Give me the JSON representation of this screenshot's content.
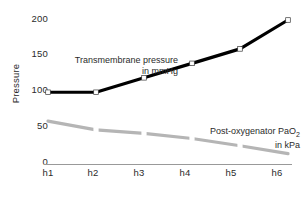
{
  "chart_data": {
    "type": "line",
    "title": "",
    "xlabel": "Time",
    "ylabel": "Pressure",
    "categories": [
      "h1",
      "h2",
      "h3",
      "h4",
      "h5",
      "h6"
    ],
    "yticks": [
      0,
      50,
      100,
      150,
      200
    ],
    "ylim": [
      0,
      215
    ],
    "grid": false,
    "legend_position": "inline-annotation",
    "series": [
      {
        "name": "Transmembrane pressure in mmHg",
        "name_line1": "Transmembrane pressure",
        "name_line2": "in mmHg",
        "unit": "mmHg",
        "color": "#000000",
        "marker": "open-square",
        "values": [
          100,
          100,
          120,
          140,
          160,
          200
        ]
      },
      {
        "name": "Post-oxygenator PaO2 in kPa",
        "name_line1_pre": "Post-oxygenator PaO",
        "name_line1_sub": "2",
        "name_line2": "in kPa",
        "unit": "kPa",
        "color": "#b5b5b5",
        "marker": "gap",
        "values": [
          60,
          48,
          43,
          36,
          26,
          15
        ]
      }
    ]
  },
  "axes": {
    "y_title": "Pressure",
    "x_title": "Time",
    "y_tick_labels": [
      "200",
      "150",
      "100",
      "50",
      "0"
    ],
    "x_tick_labels": [
      "h1",
      "h2",
      "h3",
      "h4",
      "h5",
      "h6"
    ]
  },
  "colors": {
    "background": "#ffffff",
    "axis_line": "#999999",
    "series_black": "#000000",
    "series_gray": "#b5b5b5",
    "text": "#2b2b2b"
  }
}
